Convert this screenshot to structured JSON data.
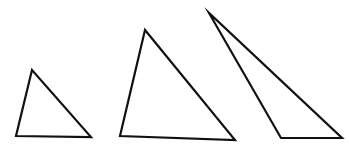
{
  "figure": {
    "background_color": "#ffffff",
    "stroke_color": "#111111",
    "fill_color": "#ffffff",
    "stroke_width": 2.2,
    "canvas": {
      "width": 349,
      "height": 150
    }
  },
  "shapes": [
    {
      "name": "small-triangle",
      "label": "Small triangle",
      "points": "32,70 16,136 91,137",
      "vertices": [
        {
          "label": "apex",
          "x": 32,
          "y": 70
        },
        {
          "label": "bottom-left",
          "x": 16,
          "y": 136
        },
        {
          "label": "bottom-right",
          "x": 91,
          "y": 137
        }
      ]
    },
    {
      "name": "medium-triangle",
      "label": "Medium triangle",
      "points": "145,30 120,136 235,140",
      "vertices": [
        {
          "label": "apex",
          "x": 145,
          "y": 30
        },
        {
          "label": "bottom-left",
          "x": 120,
          "y": 136
        },
        {
          "label": "bottom-right",
          "x": 235,
          "y": 140
        }
      ]
    },
    {
      "name": "large-thin-triangle",
      "label": "Large thin triangle",
      "points": "209,13 281,138 342,138",
      "vertices": [
        {
          "label": "apex",
          "x": 209,
          "y": 13
        },
        {
          "label": "bottom-left",
          "x": 281,
          "y": 138
        },
        {
          "label": "bottom-right",
          "x": 342,
          "y": 138
        }
      ]
    }
  ]
}
